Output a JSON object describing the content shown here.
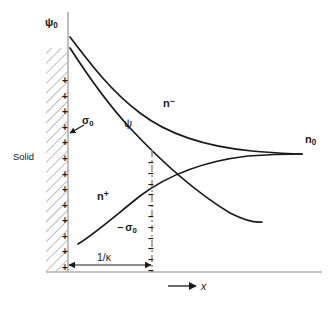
{
  "figure": {
    "type": "scientific-diagram",
    "width": 336,
    "height": 309,
    "background": "#ffffff",
    "ink_color": "#1a1a1a",
    "axis_color": "#b3b3b3"
  },
  "labels": {
    "solid": "Solid",
    "psi_zero_symbol": "ψ",
    "psi_zero_subscript": "0",
    "psi_symbol": "ψ",
    "n_minus_symbol": "n",
    "n_minus_superscript": "−",
    "n_plus_symbol": "n",
    "n_plus_superscript": "+",
    "n_bulk_symbol": "n",
    "n_bulk_subscript": "0",
    "sigma_zero_symbol": "σ",
    "sigma_zero_subscript": "0",
    "minus_sigma_zero_prefix": "− ",
    "minus_sigma_zero_symbol": "σ",
    "minus_sigma_zero_subscript": "0",
    "debye_length": "1/κ",
    "x_axis": "x"
  },
  "charges": {
    "surface_charge_glyph": "+",
    "surface_charge_count": 13,
    "counter_charge_glyph": "–",
    "counter_charge_count": 11
  },
  "chart_data": {
    "type": "line",
    "title": "",
    "xlabel": "x",
    "ylabel": "",
    "grid": false,
    "legend": "inline-curve-labels",
    "axis_origin_px": [
      68,
      272
    ],
    "annotations": [
      {
        "name": "solid-region",
        "text": "Solid",
        "note": "hatched wall left of x = 0"
      },
      {
        "name": "surface-potential",
        "text": "ψ₀",
        "note": "potential at the wall, top of vertical axis"
      },
      {
        "name": "surface-charge",
        "text": "σ₀",
        "note": "positive surface charge density on the solid, leader arrow to the + row"
      },
      {
        "name": "counter-charge",
        "text": "−σ₀",
        "note": "net negative diffuse-layer charge balancing σ₀"
      },
      {
        "name": "debye-length",
        "text": "1/κ",
        "note": "double-headed arrow from wall to dash-dot line, the Debye screening length"
      },
      {
        "name": "bulk-concentration",
        "text": "n₀",
        "note": "bulk ion concentration both curves approach at large x"
      }
    ],
    "series": [
      {
        "name": "n−",
        "label": "n⁻",
        "description": "co-ion/counter-ion concentration decaying from a high value at the wall down to the bulk value n0",
        "x": [
          0,
          0.12,
          0.25,
          0.4,
          0.55,
          0.75,
          1.0,
          1.3,
          1.7,
          2.2,
          2.8,
          3.4
        ],
        "y": [
          3.0,
          2.45,
          2.05,
          1.75,
          1.54,
          1.35,
          1.2,
          1.1,
          1.04,
          1.01,
          1.0,
          1.0
        ],
        "asymptote": 1.0
      },
      {
        "name": "n+",
        "label": "n⁺",
        "description": "ion concentration rising from a low value near the wall up to the bulk value n0",
        "x": [
          0.35,
          0.5,
          0.7,
          0.95,
          1.25,
          1.6,
          2.0,
          2.5,
          3.0,
          3.4
        ],
        "y": [
          0.12,
          0.24,
          0.4,
          0.56,
          0.7,
          0.82,
          0.9,
          0.96,
          0.99,
          1.0
        ],
        "asymptote": 1.0
      },
      {
        "name": "ψ",
        "label": "ψ",
        "description": "electric potential decaying exponentially from ψ₀ at the wall toward zero",
        "x": [
          0,
          0.15,
          0.3,
          0.5,
          0.75,
          1.05,
          1.4,
          1.8,
          2.25,
          2.7
        ],
        "y": [
          2.55,
          2.2,
          1.92,
          1.6,
          1.3,
          1.02,
          0.78,
          0.56,
          0.38,
          0.24
        ],
        "asymptote": 0.0
      }
    ]
  }
}
